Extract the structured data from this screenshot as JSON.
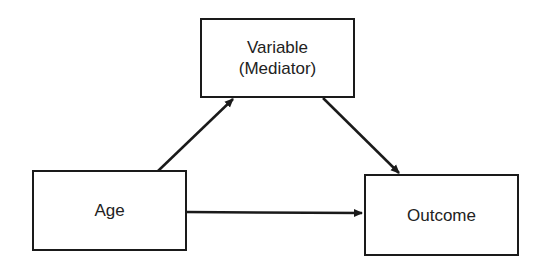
{
  "diagram": {
    "type": "mediation-model",
    "nodes": [
      {
        "id": "mediator",
        "line1": "Variable",
        "line2": "(Mediator)"
      },
      {
        "id": "age",
        "label": "Age"
      },
      {
        "id": "outcome",
        "label": "Outcome"
      }
    ],
    "edges": [
      {
        "from": "age",
        "to": "mediator"
      },
      {
        "from": "mediator",
        "to": "outcome"
      },
      {
        "from": "age",
        "to": "outcome"
      }
    ],
    "colors": {
      "stroke": "#1a1a1a",
      "text": "#222222",
      "background": "#ffffff"
    }
  }
}
